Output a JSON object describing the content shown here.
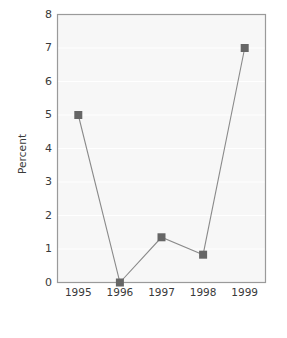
{
  "chart_data": {
    "type": "line",
    "title": "",
    "subtitle": "",
    "xlabel": "",
    "ylabel": "Percent",
    "categories": [
      "1995",
      "1996",
      "1997",
      "1998",
      "1999"
    ],
    "values": [
      5,
      0,
      1.35,
      0.83,
      7
    ],
    "series": [
      {
        "name": "Percent",
        "values": [
          5,
          0,
          1.35,
          0.83,
          7
        ]
      }
    ],
    "ylim": [
      0,
      8
    ],
    "yticks": [
      0,
      1,
      2,
      3,
      4,
      5,
      6,
      7,
      8
    ],
    "ytick_labels": [
      "0",
      "1",
      "2",
      "3",
      "4",
      "5",
      "6",
      "7",
      "8"
    ],
    "xtick_labels": [
      "1995",
      "1996",
      "1997",
      "1998",
      "1999"
    ],
    "grid": true,
    "legend": false,
    "legend_position": "none",
    "marker": "square",
    "annotations": []
  },
  "style": {
    "plot_background": "#f7f7f7",
    "gridline_color": "#ffffff",
    "frame_color": "#9a9a9a",
    "line_color": "#8a8a8a",
    "marker_color": "#666666",
    "text_color": "#3a3a3a",
    "page_background": "#ffffff"
  },
  "axis": {
    "y_title": "Percent"
  }
}
